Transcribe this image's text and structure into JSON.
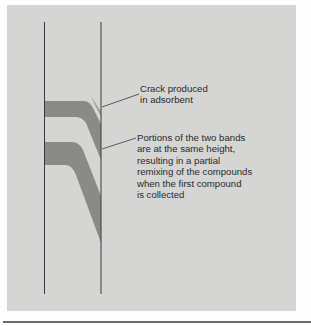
{
  "figure": {
    "colors": {
      "background_panel": "#d5d5d3",
      "band": "#8a8a88",
      "column_wall": "#3a3a3a",
      "text": "#2a2a2a"
    },
    "labels": {
      "crack": {
        "lines": [
          "Crack produced",
          "in adsorbent"
        ]
      },
      "bands": {
        "lines": [
          "Portions of the two bands",
          "are at the same height,",
          "resulting in a partial",
          "remixing of the compounds",
          "when the first compound",
          "is collected"
        ]
      }
    }
  }
}
